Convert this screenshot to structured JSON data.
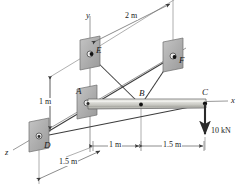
{
  "figure": {
    "type": "engineering-statics-free-body-diagram",
    "background_color": "#ffffff",
    "line_color": "#3a3a3a",
    "bracket_fill": "#b0b0b0",
    "bracket_stroke": "#7a7a7a",
    "beam_fill": "#c9c9c4",
    "beam_highlight": "#e6e6e2",
    "beam_stroke": "#5a5a5a",
    "joint_fill": "#111111"
  },
  "axes": [
    {
      "id": "axis-y",
      "label": "y",
      "x": 88,
      "y": 16
    },
    {
      "id": "axis-x",
      "label": "x",
      "x": 231,
      "y": 96
    },
    {
      "id": "axis-z",
      "label": "z",
      "x": 6,
      "y": 148
    }
  ],
  "joints": [
    {
      "id": "A",
      "label": "A",
      "label_x": 76,
      "label_y": 88,
      "px": 87,
      "py": 104,
      "support": true
    },
    {
      "id": "B",
      "label": "B",
      "label_x": 140,
      "label_y": 90,
      "px": 141,
      "py": 105,
      "support": false
    },
    {
      "id": "C",
      "label": "C",
      "label_x": 203,
      "label_y": 90,
      "px": 205,
      "py": 104,
      "support": false
    },
    {
      "id": "D",
      "label": "D",
      "label_x": 45,
      "label_y": 145,
      "px": 39,
      "py": 137,
      "support": true
    },
    {
      "id": "E",
      "label": "E",
      "label_x": 97,
      "label_y": 48,
      "px": 90,
      "py": 55,
      "support": true
    },
    {
      "id": "F",
      "label": "F",
      "label_x": 180,
      "label_y": 59,
      "px": 173,
      "py": 57,
      "support": true
    }
  ],
  "dimensions": [
    {
      "id": "dim-2m",
      "label": "2 m",
      "x": 130,
      "y": 16
    },
    {
      "id": "dim-1m-vert",
      "label": "1 m",
      "x": 44,
      "y": 100
    },
    {
      "id": "dim-1m-horiz",
      "label": "1 m",
      "x": 113,
      "y": 144
    },
    {
      "id": "dim-15m-horiz",
      "label": "1.5 m",
      "x": 170,
      "y": 144
    },
    {
      "id": "dim-15m-diag",
      "label": "1.5 m",
      "x": 63,
      "y": 163
    }
  ],
  "load": {
    "id": "load-C",
    "label": "10 kN",
    "magnitude": 10,
    "unit": "kN",
    "direction": "down",
    "label_x": 212,
    "label_y": 131,
    "tail_x": 205,
    "tail_y": 104,
    "head_x": 205,
    "head_y": 137
  },
  "members": [
    {
      "id": "member-A-C",
      "from": "A",
      "to": "C",
      "kind": "beam"
    },
    {
      "id": "member-E-B",
      "from": "E",
      "to": "B",
      "kind": "cable"
    },
    {
      "id": "member-F-B",
      "from": "F",
      "to": "B",
      "kind": "cable"
    },
    {
      "id": "member-E-F-diagonal",
      "from": "E",
      "to": "F",
      "kind": "guide"
    },
    {
      "id": "member-D-F",
      "from": "D",
      "to": "F",
      "kind": "cable"
    },
    {
      "id": "member-D-C",
      "from": "D",
      "to": "C",
      "kind": "cable"
    }
  ]
}
